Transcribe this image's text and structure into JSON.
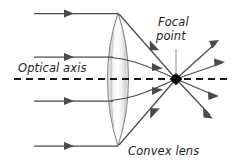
{
  "diagram": {
    "background_color": "#ffffff",
    "labels": {
      "optical_axis": "Optical axis",
      "focal_point_line1": "Focal",
      "focal_point_line2": "point",
      "convex_lens": "Convex lens"
    },
    "colors": {
      "ray": "#4a4a4a",
      "axis": "#1a1a1a",
      "lens_outline": "#8a8a8a",
      "focal_point": "#000000",
      "leader": "#8d8d8d",
      "text": "#231f20"
    },
    "geometry": {
      "focal_point_x": 176,
      "focal_point_y": 79,
      "lens_top_x": 118,
      "lens_top_y": 13,
      "lens_bottom_x": 118,
      "lens_bottom_y": 146,
      "lens_left_edge_x": 110,
      "lens_right_edge_x": 126,
      "axis_y": 79
    },
    "incoming_rays": [
      {
        "name": "ray-1-top",
        "y": 13,
        "x_start": 34,
        "x_end": 118,
        "arrow_x": 68
      },
      {
        "name": "ray-2-upper-mid",
        "y": 57,
        "x_start": 34,
        "x_end": 112,
        "arrow_x": 68
      },
      {
        "name": "ray-3-lower-mid",
        "y": 101,
        "x_start": 34,
        "x_end": 112,
        "arrow_x": 68
      },
      {
        "name": "ray-4-bottom",
        "y": 146,
        "x_start": 34,
        "x_end": 118,
        "arrow_x": 68
      }
    ],
    "refracted_rays": [
      {
        "name": "refracted-from-top",
        "from_x": 120,
        "from_y": 14,
        "to_x": 176,
        "to_y": 79,
        "arrow_t": 0.62
      },
      {
        "name": "refracted-from-upper-mid",
        "from_x": 112,
        "from_y": 57,
        "to_x": 176,
        "to_y": 79,
        "arrow_t": 0.72
      },
      {
        "name": "refracted-from-lower-mid",
        "from_x": 112,
        "from_y": 101,
        "to_x": 176,
        "to_y": 79,
        "arrow_t": 0.72
      },
      {
        "name": "refracted-from-bottom",
        "from_x": 120,
        "from_y": 145,
        "to_x": 176,
        "to_y": 79,
        "arrow_t": 0.62
      }
    ],
    "diverging_rays": [
      {
        "name": "diverging-up-steep",
        "to_x": 218,
        "to_y": 41
      },
      {
        "name": "diverging-up-shallow",
        "to_x": 224,
        "to_y": 62
      },
      {
        "name": "diverging-down-shallow",
        "to_x": 218,
        "to_y": 97
      },
      {
        "name": "diverging-down-steep",
        "to_x": 212,
        "to_y": 117
      }
    ],
    "axis_line": {
      "x_start": 14,
      "x_end": 228,
      "y": 79
    },
    "leader": {
      "x": 176,
      "y_start": 48,
      "y_end": 76
    }
  }
}
